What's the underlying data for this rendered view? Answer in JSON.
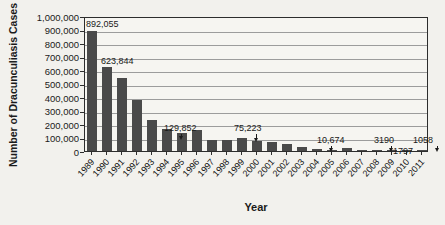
{
  "chart_data": {
    "type": "bar",
    "title": "",
    "xlabel": "Year",
    "ylabel": "Number of Dracunculiasis Cases",
    "categories": [
      "1989",
      "1990",
      "1991",
      "1992",
      "1993",
      "1994",
      "1995",
      "1996",
      "1997",
      "1998",
      "1999",
      "2000",
      "2001",
      "2002",
      "2003",
      "2004",
      "2005",
      "2006",
      "2007",
      "2008",
      "2009",
      "2010",
      "2011"
    ],
    "values": [
      892055,
      623844,
      543585,
      374202,
      229773,
      164973,
      129852,
      152814,
      77863,
      78557,
      96293,
      75223,
      63718,
      54638,
      32193,
      16026,
      10674,
      25217,
      9585,
      4619,
      3190,
      1797,
      1058
    ],
    "ylim": [
      0,
      1000000
    ],
    "ytick_labels": [
      "0",
      "100,000",
      "200,000",
      "300,000",
      "400,000",
      "500,000",
      "600,000",
      "700,000",
      "800,000",
      "900,000",
      "1,000,000"
    ],
    "grid": "horizontal",
    "legend": "none",
    "colors": {
      "bar": "#4a4a4a",
      "gridline": "#9c9c9c",
      "axis": "#2d2d2d",
      "background": "#f2f1ed",
      "text": "#1a1a1a"
    },
    "annotations": [
      {
        "text": "892,055",
        "year": "1989",
        "arrow": false
      },
      {
        "text": "623,844",
        "year": "1990",
        "arrow": false
      },
      {
        "text": "129,852",
        "year": "1995",
        "arrow": true
      },
      {
        "text": "75,223",
        "year": "2000",
        "arrow": true
      },
      {
        "text": "10,674",
        "year": "2005",
        "arrow": true
      },
      {
        "text": "3190",
        "year": "2009",
        "arrow": true
      },
      {
        "text": "1797",
        "year": "2010",
        "arrow": false
      },
      {
        "text": "1058",
        "year": "2011",
        "arrow": true
      }
    ]
  }
}
